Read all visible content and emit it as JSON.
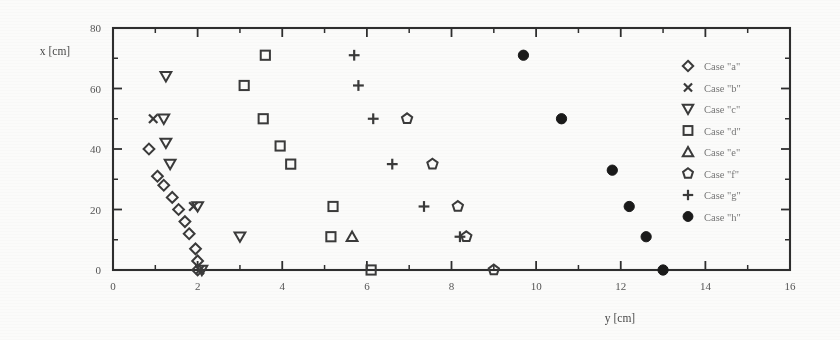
{
  "figure": {
    "background_color": "#fbfbfa",
    "ink_color": "#2e2e2e",
    "axes": {
      "x": {
        "title": "y [cm]",
        "min": 0,
        "max": 16,
        "major_ticks": [
          0,
          2,
          4,
          6,
          8,
          10,
          12,
          14,
          16
        ],
        "major_tick_labels": [
          "0",
          "2",
          "4",
          "6",
          "8",
          "10",
          "12",
          "14",
          "16"
        ],
        "minor_ticks": [
          1,
          3,
          5,
          7,
          9,
          11,
          13,
          15
        ]
      },
      "y": {
        "title": "x [cm]",
        "min": 0,
        "max": 80,
        "major_ticks": [
          0,
          20,
          40,
          60,
          80
        ],
        "major_tick_labels": [
          "0",
          "20",
          "40",
          "60",
          "80"
        ],
        "minor_ticks": [
          10,
          30,
          50,
          70
        ]
      }
    },
    "legend": {
      "position": "right-outside",
      "entries": [
        {
          "label": "Case \"a\"",
          "marker": "diamond-open",
          "series": "a"
        },
        {
          "label": "Case \"b\"",
          "marker": "cross-x",
          "series": "b"
        },
        {
          "label": "Case \"c\"",
          "marker": "triangle-down-open",
          "series": "c"
        },
        {
          "label": "Case \"d\"",
          "marker": "square-open",
          "series": "d"
        },
        {
          "label": "Case \"e\"",
          "marker": "triangle-up-open",
          "series": "e"
        },
        {
          "label": "Case \"f\"",
          "marker": "pentagon-open",
          "series": "f"
        },
        {
          "label": "Case \"g\"",
          "marker": "plus",
          "series": "g"
        },
        {
          "label": "Case \"h\"",
          "marker": "circle-filled",
          "series": "h"
        }
      ]
    }
  },
  "chart_data": {
    "type": "scatter",
    "title": "",
    "xlabel": "y [cm]",
    "ylabel": "x [cm]",
    "xlim": [
      0,
      16
    ],
    "ylim": [
      0,
      80
    ],
    "grid": false,
    "legend_position": "right-outside",
    "series": [
      {
        "name": "Case \"a\"",
        "marker": "diamond-open",
        "points": [
          [
            0.85,
            40
          ],
          [
            1.05,
            31
          ],
          [
            1.2,
            28
          ],
          [
            1.4,
            24
          ],
          [
            1.55,
            20
          ],
          [
            1.7,
            16
          ],
          [
            1.8,
            12
          ],
          [
            1.95,
            7
          ],
          [
            2.0,
            3
          ],
          [
            2.0,
            0
          ]
        ]
      },
      {
        "name": "Case \"b\"",
        "marker": "cross-x",
        "points": [
          [
            0.95,
            50
          ],
          [
            1.9,
            21
          ],
          [
            2.05,
            0
          ]
        ]
      },
      {
        "name": "Case \"c\"",
        "marker": "triangle-down-open",
        "points": [
          [
            1.25,
            64
          ],
          [
            1.2,
            50
          ],
          [
            1.25,
            42
          ],
          [
            1.35,
            35
          ],
          [
            2.0,
            21
          ],
          [
            3.0,
            11
          ],
          [
            2.1,
            0
          ]
        ]
      },
      {
        "name": "Case \"d\"",
        "marker": "square-open",
        "points": [
          [
            3.6,
            71
          ],
          [
            3.1,
            61
          ],
          [
            3.55,
            50
          ],
          [
            3.95,
            41
          ],
          [
            4.2,
            35
          ],
          [
            5.2,
            21
          ],
          [
            5.15,
            11
          ],
          [
            6.1,
            0
          ]
        ]
      },
      {
        "name": "Case \"e\"",
        "marker": "triangle-up-open",
        "points": [
          [
            5.65,
            11
          ]
        ]
      },
      {
        "name": "Case \"f\"",
        "marker": "pentagon-open",
        "points": [
          [
            6.95,
            50
          ],
          [
            7.55,
            35
          ],
          [
            8.15,
            21
          ],
          [
            8.35,
            11
          ],
          [
            9.0,
            0
          ]
        ]
      },
      {
        "name": "Case \"g\"",
        "marker": "plus",
        "points": [
          [
            5.7,
            71
          ],
          [
            5.8,
            61
          ],
          [
            6.15,
            50
          ],
          [
            6.6,
            35
          ],
          [
            7.35,
            21
          ],
          [
            8.2,
            11
          ]
        ]
      },
      {
        "name": "Case \"h\"",
        "marker": "circle-filled",
        "points": [
          [
            9.7,
            71
          ],
          [
            10.6,
            50
          ],
          [
            11.8,
            33
          ],
          [
            12.2,
            21
          ],
          [
            12.6,
            11
          ],
          [
            13.0,
            0
          ]
        ]
      }
    ]
  }
}
